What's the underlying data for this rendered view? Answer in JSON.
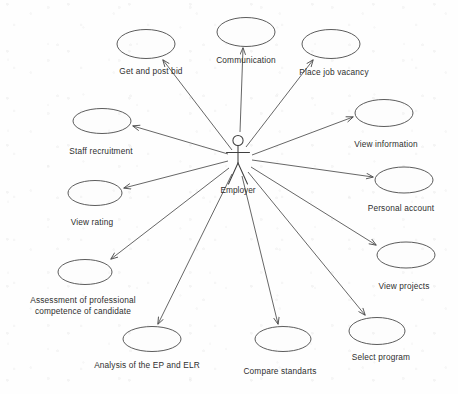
{
  "diagram": {
    "type": "uml-use-case-diagram",
    "actor": {
      "name": "Employer",
      "x": 238,
      "y": 143
    },
    "caption": "",
    "stroke_color": "#4a4a4a",
    "background_color": "#fefefe",
    "use_cases": [
      {
        "id": "get-and-post-bid",
        "label": "Get and post bid",
        "cx": 146,
        "cy": 44,
        "rx": 29,
        "ry": 14.5,
        "label_x": 151,
        "label_y": 66,
        "two_line": false
      },
      {
        "id": "communication",
        "label": "Communication",
        "cx": 246,
        "cy": 32,
        "rx": 29,
        "ry": 14.5,
        "label_x": 246,
        "label_y": 55,
        "two_line": false
      },
      {
        "id": "place-job-vacancy",
        "label": "Place job vacancy",
        "cx": 331,
        "cy": 44,
        "rx": 29,
        "ry": 14.5,
        "label_x": 334,
        "label_y": 67,
        "two_line": false
      },
      {
        "id": "view-information",
        "label": "View information",
        "cx": 384,
        "cy": 113,
        "rx": 29,
        "ry": 13.5,
        "label_x": 386,
        "label_y": 139,
        "two_line": false
      },
      {
        "id": "staff-recruitment",
        "label": "Staff recruitment",
        "cx": 102,
        "cy": 121,
        "rx": 29,
        "ry": 12.5,
        "label_x": 101,
        "label_y": 146,
        "two_line": false
      },
      {
        "id": "personal-account",
        "label": "Personal account",
        "cx": 404,
        "cy": 180,
        "rx": 29,
        "ry": 13.0,
        "label_x": 401,
        "label_y": 203,
        "two_line": false
      },
      {
        "id": "view-rating",
        "label": "View rating",
        "cx": 95,
        "cy": 193,
        "rx": 27,
        "ry": 12.5,
        "label_x": 92,
        "label_y": 217,
        "two_line": false
      },
      {
        "id": "view-projects",
        "label": "View projects",
        "cx": 406,
        "cy": 255,
        "rx": 29,
        "ry": 13.0,
        "label_x": 404,
        "label_y": 281,
        "two_line": false
      },
      {
        "id": "assessment-of-professional-competence",
        "label": "Assessment of professional competence of candidate",
        "cx": 85,
        "cy": 272,
        "rx": 27,
        "ry": 12.5,
        "label_x": 83,
        "label_y": 295,
        "two_line": true
      },
      {
        "id": "select-program",
        "label": "Select program",
        "cx": 377,
        "cy": 331,
        "rx": 28,
        "ry": 13.5,
        "label_x": 381,
        "label_y": 352,
        "two_line": false
      },
      {
        "id": "analysis-ep-elr",
        "label": "Analysis of the EP and ELR",
        "cx": 152,
        "cy": 339,
        "rx": 29,
        "ry": 12.5,
        "label_x": 147,
        "label_y": 360,
        "two_line": false
      },
      {
        "id": "compare-standarts",
        "label": "Compare standarts",
        "cx": 283,
        "cy": 339,
        "rx": 28,
        "ry": 12.5,
        "label_x": 280,
        "label_y": 366,
        "two_line": false
      }
    ],
    "associations": [
      {
        "from": "employer",
        "to": "get-and-post-bid",
        "x1": 232,
        "y1": 150,
        "x2": 163,
        "y2": 60
      },
      {
        "from": "employer",
        "to": "communication",
        "x1": 240,
        "y1": 132,
        "x2": 243,
        "y2": 48
      },
      {
        "from": "employer",
        "to": "place-job-vacancy",
        "x1": 246,
        "y1": 147,
        "x2": 313,
        "y2": 60
      },
      {
        "from": "employer",
        "to": "view-information",
        "x1": 252,
        "y1": 155,
        "x2": 353,
        "y2": 117
      },
      {
        "from": "employer",
        "to": "staff-recruitment",
        "x1": 228,
        "y1": 154,
        "x2": 133,
        "y2": 126
      },
      {
        "from": "employer",
        "to": "personal-account",
        "x1": 252,
        "y1": 160,
        "x2": 373,
        "y2": 177
      },
      {
        "from": "employer",
        "to": "view-rating",
        "x1": 228,
        "y1": 161,
        "x2": 124,
        "y2": 188
      },
      {
        "from": "employer",
        "to": "view-projects",
        "x1": 251,
        "y1": 167,
        "x2": 376,
        "y2": 245
      },
      {
        "from": "employer",
        "to": "assessment-of-professional-competence",
        "x1": 229,
        "y1": 168,
        "x2": 111,
        "y2": 259
      },
      {
        "from": "employer",
        "to": "select-program",
        "x1": 248,
        "y1": 172,
        "x2": 365,
        "y2": 315
      },
      {
        "from": "employer",
        "to": "analysis-ep-elr",
        "x1": 232,
        "y1": 174,
        "x2": 158,
        "y2": 324
      },
      {
        "from": "employer",
        "to": "compare-standarts",
        "x1": 242,
        "y1": 176,
        "x2": 278,
        "y2": 324
      }
    ]
  }
}
